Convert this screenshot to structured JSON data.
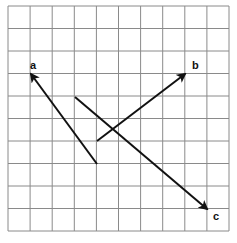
{
  "diagram": {
    "type": "vector-grid",
    "grid": {
      "columns": 10,
      "rows": 10,
      "left": 8,
      "top": 6,
      "cell_width": 22.1,
      "cell_height": 22.5,
      "line_color": "#8a8a8a"
    },
    "arrow_color": "#111111",
    "vectors": [
      {
        "label": "a",
        "from_cell": [
          4,
          7
        ],
        "to_cell": [
          1,
          3
        ],
        "from": [
          97,
          164
        ],
        "to": [
          31,
          74
        ],
        "label_pos": [
          30,
          69
        ]
      },
      {
        "label": "b",
        "from_cell": [
          4,
          6
        ],
        "to_cell": [
          8,
          3
        ],
        "from": [
          97,
          141
        ],
        "to": [
          185,
          74
        ],
        "label_pos": [
          192,
          69
        ]
      },
      {
        "label": "c",
        "from_cell": [
          3,
          4
        ],
        "to_cell": [
          9,
          9
        ],
        "from": [
          75,
          97
        ],
        "to": [
          207,
          209
        ],
        "label_pos": [
          213,
          220
        ]
      }
    ]
  }
}
